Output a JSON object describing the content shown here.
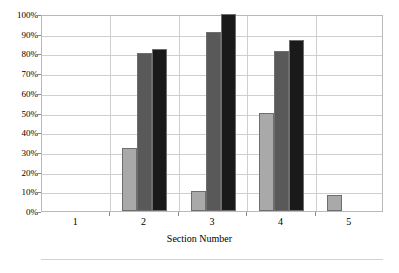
{
  "chart_data": {
    "type": "bar",
    "title": "",
    "xlabel": "Section Number",
    "ylabel": "",
    "categories": [
      "1",
      "2",
      "3",
      "4",
      "5"
    ],
    "ylim": [
      0,
      100
    ],
    "ytick_labels": [
      "0%",
      "10%",
      "20%",
      "30%",
      "40%",
      "50%",
      "60%",
      "70%",
      "80%",
      "90%",
      "100%"
    ],
    "ytick_values": [
      0,
      10,
      20,
      30,
      40,
      50,
      60,
      70,
      80,
      90,
      100
    ],
    "grid": true,
    "legend": "none",
    "value_unit": "percent",
    "series": [
      {
        "name": "series-1-light",
        "color": "#a9a9a9",
        "values": [
          null,
          32,
          10,
          50,
          8
        ]
      },
      {
        "name": "series-2-medium",
        "color": "#595959",
        "values": [
          null,
          80,
          91,
          81,
          null
        ]
      },
      {
        "name": "series-3-dark",
        "color": "#1a1a1a",
        "values": [
          null,
          82,
          100,
          87,
          null
        ]
      }
    ]
  },
  "axis": {
    "x_title": "Section Number"
  }
}
